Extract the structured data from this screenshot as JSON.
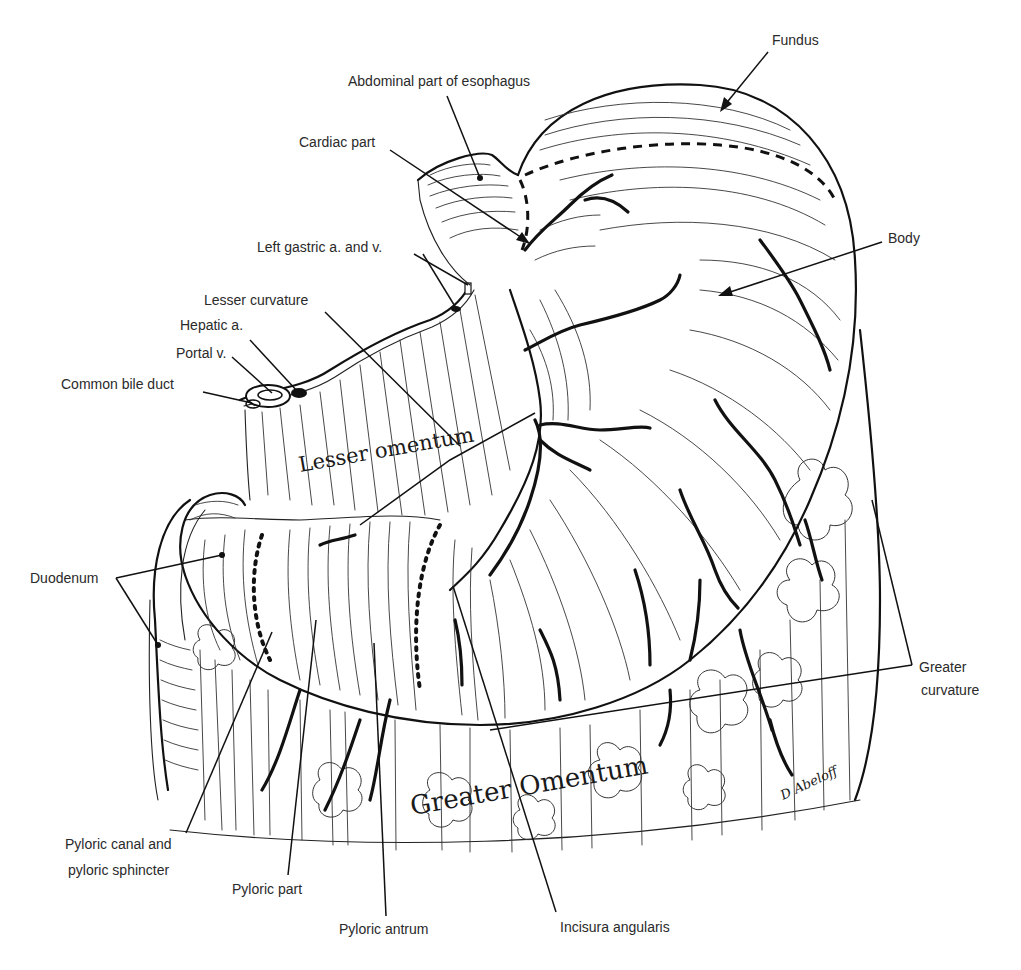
{
  "figure": {
    "labels": {
      "fundus": "Fundus",
      "abdominal_esophagus": "Abdominal part of esophagus",
      "cardiac_part": "Cardiac part",
      "body": "Body",
      "left_gastric": "Left gastric a. and v.",
      "lesser_curvature": "Lesser curvature",
      "hepatic_a": "Hepatic a.",
      "portal_v": "Portal v.",
      "common_bile_duct": "Common bile duct",
      "duodenum": "Duodenum",
      "greater_curvature_line1": "Greater",
      "greater_curvature_line2": "curvature",
      "pyloric_canal_line1": "Pyloric canal and",
      "pyloric_canal_line2": "pyloric sphincter",
      "pyloric_part": "Pyloric part",
      "pyloric_antrum": "Pyloric antrum",
      "incisura_angularis": "Incisura angularis"
    },
    "inline_labels": {
      "lesser_omentum": "Lesser omentum",
      "greater_omentum": "Greater Omentum"
    },
    "signature": "D Abeloff"
  }
}
